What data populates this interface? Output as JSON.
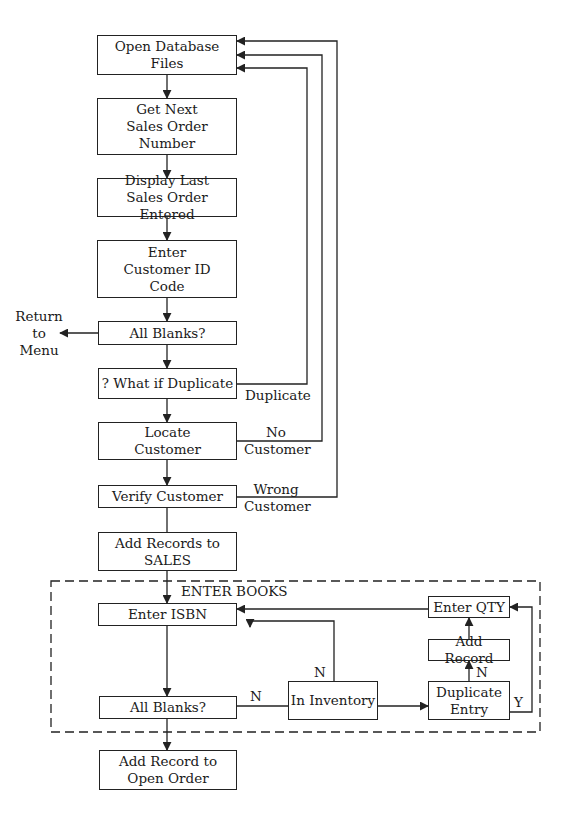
{
  "diagram": {
    "type": "flowchart",
    "colors": {
      "line": "#222222",
      "background": "#ffffff",
      "text": "#1a1a1a"
    },
    "nodes": {
      "open_db": "Open Database\nFiles",
      "get_next": "Get Next\nSales Order\nNumber",
      "display_last": "Display Last\nSales Order Entered",
      "enter_customer": "Enter\nCustomer ID\nCode",
      "all_blanks_1": "All Blanks?",
      "what_if_dup": "? What if Duplicate",
      "locate_customer": "Locate\nCustomer",
      "verify_customer": "Verify Customer",
      "add_records_sales": "Add Records to\nSALES",
      "enter_isbn": "Enter ISBN",
      "all_blanks_2": "All Blanks?",
      "in_inventory": "In Inventory",
      "duplicate_entry": "Duplicate\nEntry",
      "add_record": "Add Record",
      "enter_qty": "Enter QTY",
      "add_record_open": "Add Record to\nOpen Order"
    },
    "labels": {
      "return_to_menu": "Return\nto\nMenu",
      "duplicate": "Duplicate",
      "no_customer": "No\nCustomer",
      "wrong_customer": "Wrong\nCustomer",
      "enter_books": "ENTER BOOKS",
      "n_blanks": "N",
      "n_inventory": "N",
      "n_duplicate": "N",
      "y_duplicate": "Y"
    },
    "edges": [
      [
        "open_db",
        "get_next"
      ],
      [
        "get_next",
        "display_last"
      ],
      [
        "display_last",
        "enter_customer"
      ],
      [
        "enter_customer",
        "all_blanks_1"
      ],
      [
        "all_blanks_1",
        "return_to_menu"
      ],
      [
        "all_blanks_1",
        "what_if_dup"
      ],
      [
        "what_if_dup",
        "open_db",
        "Duplicate"
      ],
      [
        "what_if_dup",
        "locate_customer"
      ],
      [
        "locate_customer",
        "open_db",
        "No Customer"
      ],
      [
        "locate_customer",
        "verify_customer"
      ],
      [
        "verify_customer",
        "open_db",
        "Wrong Customer"
      ],
      [
        "verify_customer",
        "add_records_sales"
      ],
      [
        "add_records_sales",
        "enter_isbn"
      ],
      [
        "enter_isbn",
        "all_blanks_2"
      ],
      [
        "all_blanks_2",
        "in_inventory",
        "N"
      ],
      [
        "in_inventory",
        "enter_isbn",
        "N"
      ],
      [
        "in_inventory",
        "duplicate_entry"
      ],
      [
        "duplicate_entry",
        "add_record",
        "N"
      ],
      [
        "duplicate_entry",
        "enter_qty",
        "Y"
      ],
      [
        "add_record",
        "enter_qty"
      ],
      [
        "enter_qty",
        "enter_isbn"
      ],
      [
        "all_blanks_2",
        "add_record_open"
      ]
    ]
  }
}
